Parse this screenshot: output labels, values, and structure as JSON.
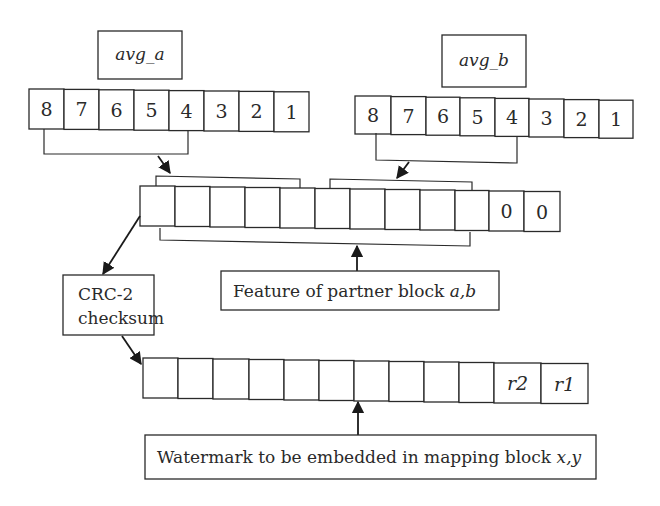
{
  "title_boxes": {
    "avg_a": "avg_a",
    "avg_b": "avg_b"
  },
  "bits_a": [
    "8",
    "7",
    "6",
    "5",
    "4",
    "3",
    "2",
    "1"
  ],
  "bits_b": [
    "8",
    "7",
    "6",
    "5",
    "4",
    "3",
    "2",
    "1"
  ],
  "feature_row": [
    "",
    "",
    "",
    "",
    "",
    "",
    "",
    "",
    "",
    "",
    "0",
    "0"
  ],
  "watermark_row": [
    "",
    "",
    "",
    "",
    "",
    "",
    "",
    "",
    "",
    "",
    "r2",
    "r1"
  ],
  "labels": {
    "crc_line1": "CRC-2",
    "crc_line2": "checksum",
    "feature_text": "Feature of partner block ",
    "feature_vars": "a,b",
    "watermark_text": "Watermark to be embedded in mapping block ",
    "watermark_vars": "x,y"
  }
}
